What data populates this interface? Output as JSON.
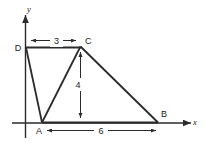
{
  "figure": {
    "type": "geometry-diagram",
    "title": "",
    "background_color": "#ffffff",
    "stroke_color": "#2b2b2b",
    "axes": {
      "x_label": "x",
      "y_label": "y",
      "origin_shown": true
    },
    "vertices": [
      {
        "name": "A",
        "label": "A",
        "x": 0,
        "y": 0
      },
      {
        "name": "B",
        "label": "B",
        "x": 6,
        "y": 0
      },
      {
        "name": "C",
        "label": "C",
        "x": 2,
        "y": 4
      },
      {
        "name": "D",
        "label": "D",
        "x": -1,
        "y": 4
      }
    ],
    "edges": [
      {
        "from": "D",
        "to": "C"
      },
      {
        "from": "C",
        "to": "B"
      },
      {
        "from": "B",
        "to": "A"
      },
      {
        "from": "A",
        "to": "D"
      },
      {
        "from": "A",
        "to": "C"
      }
    ],
    "dimensions": [
      {
        "name": "dc-width",
        "label": "3",
        "orientation": "horizontal",
        "value": 3
      },
      {
        "name": "c-height",
        "label": "4",
        "orientation": "vertical",
        "value": 4
      },
      {
        "name": "ab-length",
        "label": "6",
        "orientation": "horizontal",
        "value": 6
      }
    ]
  }
}
